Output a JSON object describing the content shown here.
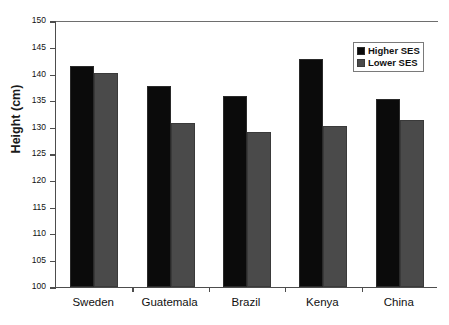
{
  "chart_data": {
    "type": "bar",
    "title": "",
    "xlabel": "",
    "ylabel": "Height (cm)",
    "ylim": [
      100,
      150
    ],
    "ytick_labels": [
      "150",
      "145",
      "140",
      "135",
      "130",
      "125",
      "120",
      "115",
      "110",
      "105",
      "100"
    ],
    "yticks": [
      150,
      145,
      140,
      135,
      130,
      125,
      120,
      115,
      110,
      105,
      100
    ],
    "grid": false,
    "legend_position": "top-right",
    "categories": [
      "Sweden",
      "Guatemala",
      "Brazil",
      "Kenya",
      "China"
    ],
    "series": [
      {
        "name": "Higher SES",
        "color": "#0b0b0b",
        "values": [
          141.5,
          137.8,
          135.9,
          142.9,
          135.4
        ]
      },
      {
        "name": "Lower SES",
        "color": "#4a4a4a",
        "values": [
          140.2,
          130.9,
          129.2,
          130.3,
          131.4
        ]
      }
    ]
  }
}
